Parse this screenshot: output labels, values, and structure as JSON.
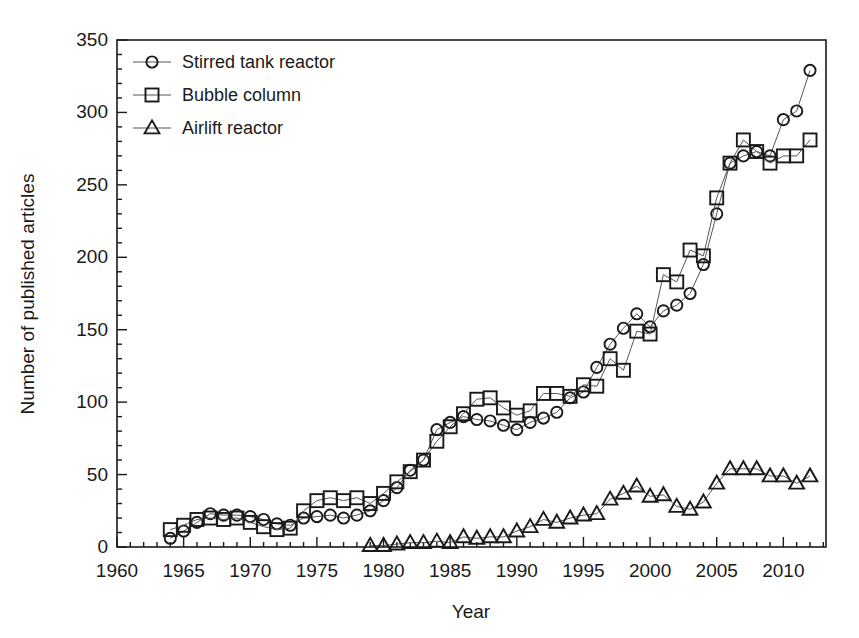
{
  "chart_data": {
    "type": "line",
    "title": "",
    "xlabel": "Year",
    "ylabel": "Number of published articles",
    "xlim": [
      1960,
      2013.2
    ],
    "ylim": [
      0,
      350
    ],
    "x_major_ticks": [
      1960,
      1965,
      1970,
      1975,
      1980,
      1985,
      1990,
      1995,
      2000,
      2005,
      2010
    ],
    "x_minor_step": 1,
    "y_major_ticks": [
      0,
      50,
      100,
      150,
      200,
      250,
      300,
      350
    ],
    "y_minor_step": 10,
    "grid": false,
    "legend_position": "top-left-inside",
    "colors": {
      "marker": "#1a1a1a",
      "line": "#555555",
      "text": "#1a1a1a",
      "frame": "#1a1a1a"
    },
    "series": [
      {
        "name": "Stirred tank reactor",
        "marker": "circle",
        "x": [
          1964,
          1965,
          1966,
          1967,
          1968,
          1969,
          1970,
          1971,
          1972,
          1973,
          1974,
          1975,
          1976,
          1977,
          1978,
          1979,
          1980,
          1981,
          1982,
          1983,
          1984,
          1985,
          1986,
          1987,
          1988,
          1989,
          1990,
          1991,
          1992,
          1993,
          1994,
          1995,
          1996,
          1997,
          1998,
          1999,
          2000,
          2001,
          2002,
          2003,
          2004,
          2005,
          2006,
          2007,
          2008,
          2009,
          2010,
          2011,
          2012
        ],
        "values": [
          6,
          11,
          17,
          23,
          22,
          22,
          21,
          19,
          16,
          15,
          20,
          21,
          22,
          20,
          22,
          25,
          32,
          41,
          53,
          60,
          81,
          86,
          90,
          88,
          87,
          84,
          81,
          86,
          89,
          93,
          103,
          107,
          124,
          140,
          151,
          161,
          152,
          163,
          167,
          175,
          195,
          230,
          265,
          270,
          273,
          270,
          295,
          301,
          329
        ]
      },
      {
        "name": "Bubble column",
        "marker": "square",
        "x": [
          1964,
          1965,
          1966,
          1967,
          1968,
          1969,
          1970,
          1971,
          1972,
          1973,
          1974,
          1975,
          1976,
          1977,
          1978,
          1979,
          1980,
          1981,
          1982,
          1983,
          1984,
          1985,
          1986,
          1987,
          1988,
          1989,
          1990,
          1991,
          1992,
          1993,
          1994,
          1995,
          1996,
          1997,
          1998,
          1999,
          2000,
          2001,
          2002,
          2003,
          2004,
          2005,
          2006,
          2007,
          2008,
          2009,
          2010,
          2011,
          2012
        ],
        "values": [
          12,
          15,
          19,
          20,
          19,
          20,
          17,
          14,
          12,
          13,
          25,
          32,
          34,
          32,
          34,
          30,
          37,
          45,
          52,
          60,
          73,
          83,
          92,
          102,
          103,
          96,
          91,
          94,
          106,
          106,
          104,
          112,
          111,
          130,
          122,
          149,
          147,
          188,
          183,
          205,
          201,
          241,
          265,
          281,
          273,
          265,
          270,
          270,
          281
        ]
      },
      {
        "name": "Airlift reactor",
        "marker": "triangle",
        "x": [
          1979,
          1980,
          1981,
          1982,
          1983,
          1984,
          1985,
          1986,
          1987,
          1988,
          1989,
          1990,
          1991,
          1992,
          1993,
          1994,
          1995,
          1996,
          1997,
          1998,
          1999,
          2000,
          2001,
          2002,
          2003,
          2004,
          2005,
          2006,
          2007,
          2008,
          2009,
          2010,
          2011,
          2012
        ],
        "values": [
          1,
          1,
          2,
          3,
          3,
          4,
          3,
          7,
          6,
          7,
          7,
          11,
          14,
          19,
          17,
          20,
          22,
          23,
          33,
          37,
          42,
          35,
          36,
          28,
          26,
          31,
          44,
          54,
          54,
          54,
          49,
          49,
          44,
          49
        ]
      }
    ]
  },
  "legend": {
    "items": [
      {
        "label": "Stirred tank reactor",
        "marker": "circle"
      },
      {
        "label": "Bubble column",
        "marker": "square"
      },
      {
        "label": "Airlift reactor",
        "marker": "triangle"
      }
    ]
  }
}
